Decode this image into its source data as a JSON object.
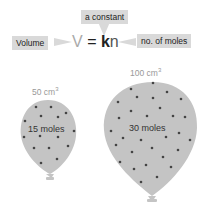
{
  "equation": {
    "constant_label": "a constant",
    "volume_label": "Volume",
    "moles_label": "no. of moles",
    "V": "V",
    "equals": "=",
    "k": "k",
    "n": "n"
  },
  "balloons": [
    {
      "volume": "50 cm",
      "volume_exp": "3",
      "moles": "15 moles"
    },
    {
      "volume": "100 cm",
      "volume_exp": "3",
      "moles": "30 moles"
    }
  ],
  "colors": {
    "balloon": "#c4c4c4",
    "dot": "#444444",
    "label_bg": "#d9d9d9"
  }
}
